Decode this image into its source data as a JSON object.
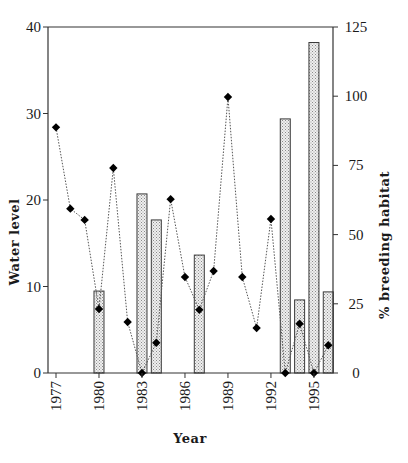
{
  "chart_data": {
    "type": "bar+line",
    "title": "",
    "xlabel": "Year",
    "ylabel_left": "Water level",
    "ylabel_right": "% breeding habitat",
    "ylim_left": [
      0,
      40
    ],
    "ylim_right": [
      0,
      125
    ],
    "left_ticks": [
      "0",
      "10",
      "20",
      "30",
      "40"
    ],
    "right_ticks": [
      "0",
      "25",
      "50",
      "75",
      "100",
      "125"
    ],
    "x_ticks": [
      "1977",
      "1980",
      "1983",
      "1986",
      "1989",
      "1992",
      "1995"
    ],
    "grid": false,
    "legend": "none",
    "series": [
      {
        "name": "Water level",
        "kind": "line",
        "axis": "left",
        "marker": "diamond",
        "line_style": "dotted",
        "x": [
          1977,
          1978,
          1979,
          1980,
          1981,
          1982,
          1983,
          1984,
          1985,
          1986,
          1987,
          1988,
          1989,
          1990,
          1991,
          1992,
          1993,
          1994,
          1995,
          1996
        ],
        "values": [
          28.4,
          19.0,
          17.7,
          7.4,
          23.7,
          5.9,
          0.0,
          3.5,
          20.1,
          11.1,
          7.3,
          11.8,
          31.9,
          11.1,
          5.2,
          17.8,
          0.0,
          5.7,
          0.0,
          3.2
        ]
      },
      {
        "name": "% breeding habitat",
        "kind": "bar",
        "axis": "right",
        "fill": "stippled-grey",
        "x": [
          1980,
          1983,
          1984,
          1987,
          1993,
          1994,
          1995,
          1996
        ],
        "values": [
          29.6,
          64.7,
          55.3,
          42.6,
          91.8,
          26.4,
          119.4,
          29.3
        ]
      }
    ]
  },
  "colors": {
    "axis": "#333333",
    "bar_fill": "#d9d9d9",
    "bar_stroke": "#3a3a3a",
    "marker": "#000000",
    "line": "#555555"
  }
}
